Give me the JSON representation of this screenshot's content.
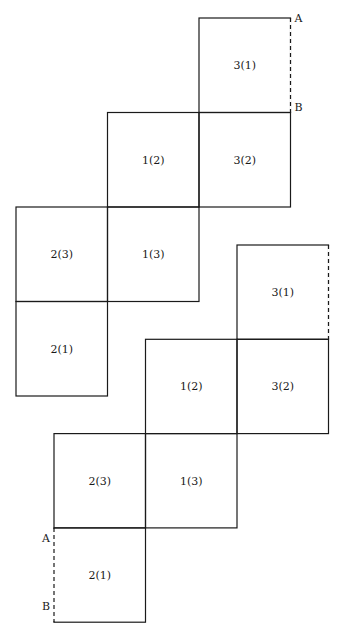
{
  "diagram": {
    "type": "cube-nets",
    "nets": [
      {
        "id": "net-1",
        "faces": [
          {
            "label": "3(1)",
            "col": 2,
            "row": 0
          },
          {
            "label": "1(2)",
            "col": 1,
            "row": 1
          },
          {
            "label": "3(2)",
            "col": 2,
            "row": 1
          },
          {
            "label": "2(3)",
            "col": 0,
            "row": 2
          },
          {
            "label": "1(3)",
            "col": 1,
            "row": 2
          },
          {
            "label": "2(1)",
            "col": 0,
            "row": 3
          }
        ],
        "dashed_edges": [
          {
            "face": "3(1)",
            "side": "right",
            "start_label": "A",
            "end_label": "B"
          }
        ]
      },
      {
        "id": "net-2",
        "faces": [
          {
            "label": "3(1)",
            "col": 2,
            "row": 0
          },
          {
            "label": "1(2)",
            "col": 1,
            "row": 1
          },
          {
            "label": "3(2)",
            "col": 2,
            "row": 1
          },
          {
            "label": "2(3)",
            "col": 0,
            "row": 2
          },
          {
            "label": "1(3)",
            "col": 1,
            "row": 2
          },
          {
            "label": "2(1)",
            "col": 0,
            "row": 3
          }
        ],
        "dashed_edges": [
          {
            "face": "3(1)",
            "side": "right",
            "start_label": "",
            "end_label": ""
          },
          {
            "face": "2(1)",
            "side": "left",
            "start_label": "A",
            "end_label": "B"
          }
        ]
      }
    ]
  }
}
